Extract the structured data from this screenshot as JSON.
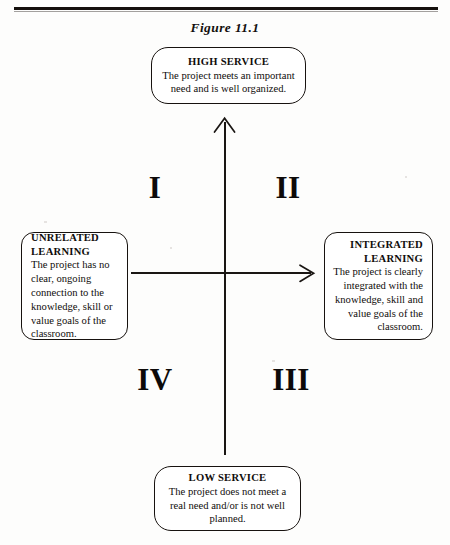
{
  "figure": {
    "caption": "Figure 11.1"
  },
  "axes": {
    "vertical_name": "service-axis",
    "horizontal_name": "learning-axis",
    "vertical_arrow": "arrow-up-icon",
    "horizontal_arrow": "arrow-right-icon"
  },
  "boxes": {
    "high_service": {
      "heading": "HIGH SERVICE",
      "body": "The project meets an important need and is well organized."
    },
    "low_service": {
      "heading": "LOW SERVICE",
      "body": "The project does not meet a real need and/or is not well planned."
    },
    "unrelated_learning": {
      "heading": "UNRELATED LEARNING",
      "body": "The project has no clear, ongoing connection to the knowledge, skill or value goals of the classroom."
    },
    "integrated_learning": {
      "heading": "INTEGRATED LEARNING",
      "body": "The project is clearly integrated with the knowledge, skill and value goals of the classroom."
    }
  },
  "quadrants": [
    {
      "label": "I",
      "name": "quadrant-one"
    },
    {
      "label": "II",
      "name": "quadrant-two"
    },
    {
      "label": "III",
      "name": "quadrant-three"
    },
    {
      "label": "IV",
      "name": "quadrant-four"
    }
  ],
  "colors": {
    "ink": "#15100d",
    "page": "#fdfdfc"
  }
}
